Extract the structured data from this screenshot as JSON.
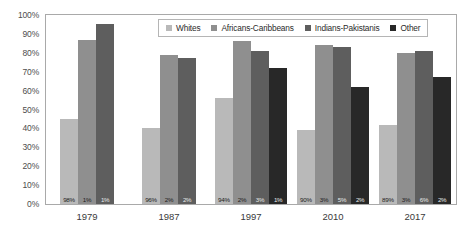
{
  "chart_data": {
    "type": "bar",
    "title": "",
    "subtitle": "",
    "xlabel": "",
    "ylabel": "",
    "ylim": [
      0,
      100
    ],
    "y_ticks": [
      "0%",
      "10%",
      "20%",
      "30%",
      "40%",
      "50%",
      "60%",
      "70%",
      "80%",
      "90%",
      "100%"
    ],
    "y_tick_values": [
      0,
      10,
      20,
      30,
      40,
      50,
      60,
      70,
      80,
      90,
      100
    ],
    "grid": true,
    "legend_position": "top-center",
    "categories": [
      "1979",
      "1987",
      "1997",
      "2010",
      "2017"
    ],
    "series": [
      {
        "name": "Whites",
        "color": "#b9b9b9",
        "values": [
          45,
          40,
          56,
          39,
          42
        ],
        "labels": [
          "98%",
          "96%",
          "94%",
          "90%",
          "89%"
        ]
      },
      {
        "name": "Africans-Caribbeans",
        "color": "#8f8f8f",
        "values": [
          87,
          79,
          86,
          84,
          80
        ],
        "labels": [
          "1%",
          "2%",
          "2%",
          "3%",
          "3%"
        ]
      },
      {
        "name": "Indians-Pakistanis",
        "color": "#5e5e5e",
        "values": [
          95,
          77,
          81,
          83,
          81
        ],
        "labels": [
          "1%",
          "2%",
          "3%",
          "5%",
          "6%"
        ]
      },
      {
        "name": "Other",
        "color": "#282828",
        "values": [
          null,
          null,
          72,
          62,
          67
        ],
        "labels": [
          null,
          null,
          "1%",
          "2%",
          "2%"
        ]
      }
    ]
  },
  "colors": {
    "plot_border": "#a9a9a9",
    "gridline": "#f0f0f0",
    "background": "#ffffff",
    "axis_text": "#4d4d4d",
    "legend_border": "#b5b5b5"
  }
}
